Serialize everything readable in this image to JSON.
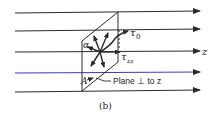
{
  "diagram": {
    "caption": "(b)",
    "axis_label": "z",
    "labels": {
      "alpha": "α",
      "tau0": "τ",
      "tau0_sub": "0",
      "tauzz": "τ",
      "tauzz_sub": "zz",
      "point_a": "A",
      "plane": "Plane ⊥ to z"
    },
    "flow_lines_count": 5,
    "colors": {
      "line": "#2a2a2a",
      "highlight_line": "#3a3ad0",
      "background": "#ffffff"
    }
  }
}
